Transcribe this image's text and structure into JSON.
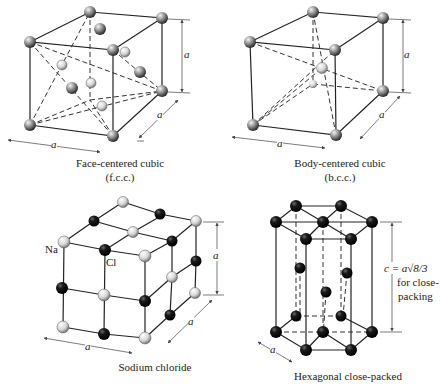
{
  "figures": [
    {
      "id": "fcc",
      "title": "Face-centered cubic",
      "abbr": "(f.c.c.)",
      "dimension_labels": [
        "a",
        "a",
        "a"
      ]
    },
    {
      "id": "bcc",
      "title": "Body-centered cubic",
      "abbr": "(b.c.c.)",
      "dimension_labels": [
        "a",
        "a",
        "a"
      ]
    },
    {
      "id": "nacl",
      "title": "Sodium chloride",
      "atom_labels": [
        "Na",
        "Cl"
      ],
      "dimension_labels": [
        "a",
        "a",
        "a"
      ]
    },
    {
      "id": "hcp",
      "title": "Hexagonal close-packed",
      "dimension_labels": [
        "a"
      ],
      "height_formula": "c = a√8/3",
      "height_note_line1": "for close-",
      "height_note_line2": "packing"
    }
  ],
  "colors": {
    "background": "#ffffff",
    "line": "#222222",
    "atom_gray": "#8a8a8a",
    "atom_light": "#d8d8d8",
    "atom_dark": "#111111"
  }
}
